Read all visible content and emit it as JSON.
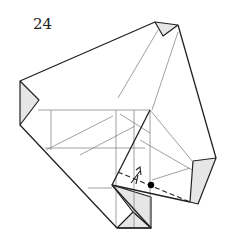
{
  "step": {
    "number": "24"
  },
  "diagram": {
    "type": "origami-fold-diagram",
    "colors": {
      "outline": "#222222",
      "crease": "#888888",
      "flap_fill": "#e6e6e6",
      "dot": "#000000"
    },
    "symbols": [
      "valley-fold-dashed-line",
      "fold-arrow",
      "reference-dot"
    ]
  }
}
